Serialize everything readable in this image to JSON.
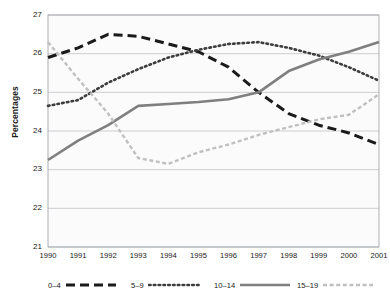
{
  "chart_data": {
    "type": "line",
    "title": "",
    "xlabel": "",
    "ylabel": "Percentages",
    "x": [
      1990,
      1991,
      1992,
      1993,
      1994,
      1995,
      1996,
      1997,
      1998,
      1999,
      2000,
      2001
    ],
    "xticklabels": [
      "1990",
      "1991",
      "1992",
      "1993",
      "1994",
      "1995",
      "1996",
      "1997",
      "1998",
      "1999",
      "2000",
      "2001"
    ],
    "yticklabels": [
      "21",
      "22",
      "23",
      "24",
      "25",
      "26",
      "27"
    ],
    "ylim": [
      21,
      27
    ],
    "ytick_values": [
      21,
      22,
      23,
      24,
      25,
      26,
      27
    ],
    "grid": "horizontal",
    "legend_position": "bottom",
    "series": [
      {
        "name": "0–4",
        "style": "dashed",
        "color": "#1a1a1a",
        "values": [
          25.9,
          26.15,
          26.5,
          26.45,
          26.25,
          26.05,
          25.65,
          25.0,
          24.45,
          24.15,
          23.95,
          23.65
        ]
      },
      {
        "name": "5–9",
        "style": "dotted",
        "color": "#3d3d3d",
        "values": [
          24.65,
          24.8,
          25.25,
          25.6,
          25.9,
          26.1,
          26.25,
          26.3,
          26.15,
          25.95,
          25.65,
          25.3
        ]
      },
      {
        "name": "10–14",
        "style": "solid",
        "color": "#7f7f7f",
        "values": [
          23.25,
          23.75,
          24.15,
          24.65,
          24.7,
          24.75,
          24.82,
          25.0,
          25.55,
          25.85,
          26.05,
          26.3
        ]
      },
      {
        "name": "15–19",
        "style": "light-dashed",
        "color": "#c0c0c0",
        "values": [
          26.3,
          25.35,
          24.45,
          23.3,
          23.15,
          23.45,
          23.65,
          23.9,
          24.1,
          24.3,
          24.42,
          24.95
        ]
      }
    ]
  }
}
